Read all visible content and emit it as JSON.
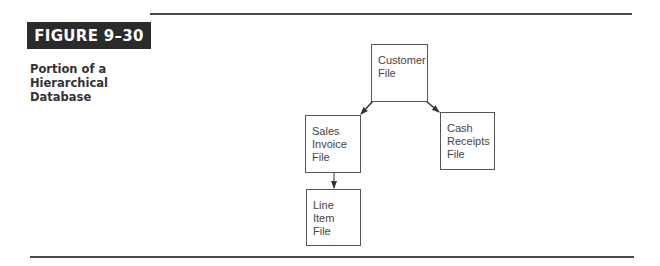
{
  "figure": {
    "label": "FIGURE 9–30",
    "caption_lines": [
      "Portion of a",
      "Hierarchical",
      "Database"
    ]
  },
  "diagram": {
    "type": "hierarchy",
    "nodes": [
      {
        "id": "customer",
        "lines": [
          "Customer",
          "File"
        ]
      },
      {
        "id": "sales_invoice",
        "lines": [
          "Sales",
          "Invoice",
          "File"
        ]
      },
      {
        "id": "cash_receipts",
        "lines": [
          "Cash",
          "Receipts",
          "File"
        ]
      },
      {
        "id": "line_item",
        "lines": [
          "Line",
          "Item",
          "File"
        ]
      }
    ],
    "edges": [
      {
        "from": "customer",
        "to": "sales_invoice"
      },
      {
        "from": "customer",
        "to": "cash_receipts"
      },
      {
        "from": "sales_invoice",
        "to": "line_item"
      }
    ]
  }
}
